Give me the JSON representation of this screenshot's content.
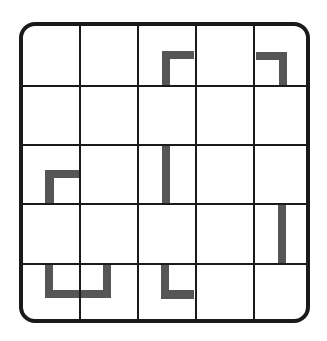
{
  "puzzle": {
    "rows": 5,
    "cols": 5,
    "line_color": "#1a1a1a",
    "piece_color": "#555555",
    "background": "#ffffff",
    "pieces": [
      {
        "name": "piece-r1c3-corner",
        "row": 1,
        "col": 3,
        "shape": "corner-top-left",
        "description": "horizontal bar on top with vertical bar on left, opening down-right"
      },
      {
        "name": "piece-r1c5-corner",
        "row": 1,
        "col": 5,
        "shape": "corner-top-right",
        "description": "horizontal bar on top with vertical bar on right"
      },
      {
        "name": "piece-r3c1-corner",
        "row": 3,
        "col": 1,
        "shape": "corner-top-left",
        "description": "horizontal bar on top with vertical bar on left"
      },
      {
        "name": "piece-r3c3-bar",
        "row": 3,
        "col": 3,
        "shape": "vertical-bar-left",
        "description": "vertical bar on left side of cell"
      },
      {
        "name": "piece-r4c5-bar",
        "row": 4,
        "col": 5,
        "shape": "vertical-bar-center",
        "description": "vertical bar through cell"
      },
      {
        "name": "piece-r5c1-c2-u",
        "row": 5,
        "col": 1,
        "span_cols": 2,
        "shape": "u-shape",
        "description": "U shape spanning two cells"
      },
      {
        "name": "piece-r5c3-corner",
        "row": 5,
        "col": 3,
        "shape": "corner-bottom-left",
        "description": "vertical bar on left with horizontal bar on bottom"
      }
    ]
  }
}
